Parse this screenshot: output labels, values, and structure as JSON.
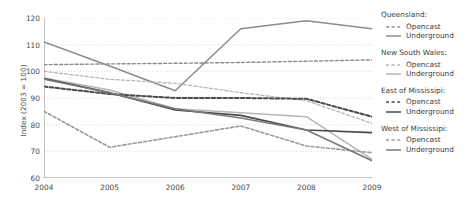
{
  "chart_data": {
    "type": "line",
    "title": "",
    "xlabel": "",
    "ylabel": "Index (2003 = 100)",
    "x": [
      2004,
      2005,
      2006,
      2007,
      2008,
      2009
    ],
    "xlim": [
      2004,
      2009
    ],
    "ylim": [
      60,
      120
    ],
    "yticks": [
      60,
      70,
      80,
      90,
      100,
      110,
      120
    ],
    "xticks": [
      "2004",
      "2005",
      "2006",
      "2007",
      "2008",
      "2009"
    ],
    "grid": true,
    "legend_position": "right",
    "series": [
      {
        "name": "Queensland: Opencast",
        "group": "Queensland",
        "style": "dashed",
        "color": "#8c8c8c",
        "width": 1.4,
        "values": [
          102.5,
          102.8,
          103.0,
          103.3,
          103.8,
          104.3
        ]
      },
      {
        "name": "Queensland: Underground",
        "group": "Queensland",
        "style": "solid",
        "color": "#8c8c8c",
        "width": 1.5,
        "values": [
          111.0,
          102.0,
          92.7,
          116.0,
          119.0,
          116.0
        ]
      },
      {
        "name": "New South Wales: Opencast",
        "group": "New South Wales",
        "style": "dashed",
        "color": "#b5b5b5",
        "width": 1.3,
        "values": [
          100.0,
          97.0,
          95.5,
          92.0,
          89.0,
          80.5
        ]
      },
      {
        "name": "New South Wales: Underground",
        "group": "New South Wales",
        "style": "solid",
        "color": "#b5b5b5",
        "width": 1.4,
        "values": [
          97.5,
          93.0,
          86.0,
          84.5,
          83.0,
          67.0
        ]
      },
      {
        "name": "East of Mississipi: Opencast",
        "group": "East of Mississipi",
        "style": "dashed",
        "color": "#4a4a4a",
        "width": 2.0,
        "values": [
          94.3,
          91.5,
          90.0,
          90.0,
          89.7,
          83.0
        ]
      },
      {
        "name": "East of Mississipi: Underground",
        "group": "East of Mississipi",
        "style": "solid",
        "color": "#4a4a4a",
        "width": 1.7,
        "values": [
          97.3,
          92.0,
          85.5,
          83.5,
          78.0,
          77.0
        ]
      },
      {
        "name": "West of Mississipi: Opencast",
        "group": "West of Mississipi",
        "style": "dashed",
        "color": "#9a9a9a",
        "width": 1.6,
        "values": [
          85.0,
          71.5,
          75.5,
          79.5,
          72.0,
          69.5
        ]
      },
      {
        "name": "West of Mississipi: Underground",
        "group": "West of Mississipi",
        "style": "solid",
        "color": "#7a7a7a",
        "width": 1.6,
        "values": [
          97.0,
          92.0,
          86.0,
          82.5,
          78.0,
          66.5
        ]
      }
    ]
  },
  "legend": {
    "groups": [
      {
        "title": "Queensland:",
        "items": [
          {
            "label": "Opencast",
            "style": "dashed",
            "color": "#8c8c8c"
          },
          {
            "label": "Underground",
            "style": "solid",
            "color": "#8c8c8c"
          }
        ]
      },
      {
        "title": "New South Wales:",
        "items": [
          {
            "label": "Opencast",
            "style": "dashed",
            "color": "#b5b5b5"
          },
          {
            "label": "Underground",
            "style": "solid",
            "color": "#b5b5b5"
          }
        ]
      },
      {
        "title": "East of Mississipi:",
        "items": [
          {
            "label": "Opencast",
            "style": "dashed",
            "color": "#4a4a4a"
          },
          {
            "label": "Underground",
            "style": "solid",
            "color": "#4a4a4a"
          }
        ]
      },
      {
        "title": "West of Mississipi:",
        "items": [
          {
            "label": "Opencast",
            "style": "dashed",
            "color": "#9a9a9a"
          },
          {
            "label": "Underground",
            "style": "solid",
            "color": "#7a7a7a"
          }
        ]
      }
    ]
  },
  "colors": {
    "axis": "#8a8a8a",
    "grid": "#d2d2d2",
    "text": "#3d3d3d",
    "background": "#ffffff"
  }
}
